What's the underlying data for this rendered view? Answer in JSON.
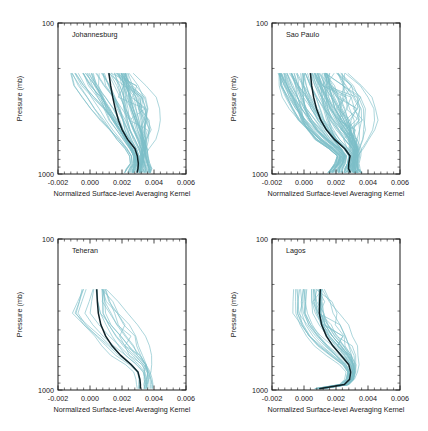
{
  "figure": {
    "layout": "2x2 grid of vertical profile line plots",
    "background_color": "#ffffff",
    "ensemble_color": "#7dbfc8",
    "mean_color": "#0e2127",
    "axis_color": "#1a1a1a"
  },
  "chart_data": [
    {
      "type": "line",
      "title": "Johannesburg",
      "xlabel": "Normalized Surface-level Averaging Kernel",
      "ylabel": "Pressure (mb)",
      "xlim": [
        -0.002,
        0.006
      ],
      "ylim": [
        100,
        1000
      ],
      "yscale": "log",
      "y_inverted": true,
      "xticks": [
        -0.002,
        0.0,
        0.002,
        0.004,
        0.006
      ],
      "xtick_labels": [
        "-0.002",
        "0.000",
        "0.002",
        "0.004",
        "0.006"
      ],
      "yticks": [
        100,
        1000
      ],
      "ytick_labels": [
        "100",
        "1000"
      ],
      "grid": false,
      "legend": "none",
      "pressure_levels": [
        215,
        260,
        310,
        370,
        440,
        510,
        590,
        680,
        760,
        850,
        920,
        980
      ],
      "series": [
        {
          "name": "mean",
          "style": "black-thick",
          "values": [
            0.00118,
            0.00129,
            0.00142,
            0.00158,
            0.00178,
            0.00201,
            0.00235,
            0.00281,
            0.00296,
            0.00302,
            0.003,
            0.00295
          ]
        },
        {
          "name": "ensemble-envelope-low",
          "style": "teal-thin",
          "values": [
            -0.0012,
            -0.00075,
            -0.00025,
            0.00025,
            0.00075,
            0.0012,
            0.00165,
            0.00215,
            0.00245,
            0.0025,
            0.00225,
            0.00215
          ]
        },
        {
          "name": "ensemble-envelope-high",
          "style": "teal-thin",
          "values": [
            0.00235,
            0.00255,
            0.00275,
            0.00292,
            0.0031,
            0.00325,
            0.0034,
            0.00355,
            0.0036,
            0.0037,
            0.00385,
            0.00385
          ]
        },
        {
          "name": "ensemble-outlier-right",
          "style": "teal-thin",
          "values": [
            0.0023,
            0.003,
            0.00345,
            0.00365,
            0.00372,
            0.00372,
            0.00365,
            0.0035,
            0.00332,
            0.00322,
            0.00318,
            0.00315
          ]
        }
      ],
      "ensemble_count_hint": 60
    },
    {
      "type": "line",
      "title": "Sao Paulo",
      "xlabel": "Normalized Surface-level Averaging Kernel",
      "ylabel": "Pressure (mb)",
      "xlim": [
        -0.002,
        0.006
      ],
      "ylim": [
        100,
        1000
      ],
      "yscale": "log",
      "y_inverted": true,
      "xticks": [
        -0.002,
        0.0,
        0.002,
        0.004,
        0.006
      ],
      "xtick_labels": [
        "-0.002",
        "0.000",
        "0.002",
        "0.004",
        "0.006"
      ],
      "yticks": [
        100,
        1000
      ],
      "ytick_labels": [
        "100",
        "1000"
      ],
      "grid": false,
      "legend": "none",
      "pressure_levels": [
        215,
        260,
        310,
        370,
        440,
        510,
        590,
        680,
        760,
        850,
        920,
        980
      ],
      "series": [
        {
          "name": "mean",
          "style": "black-thick",
          "values": [
            0.0004,
            0.00048,
            0.0006,
            0.00078,
            0.00105,
            0.0014,
            0.0019,
            0.00255,
            0.00288,
            0.0028,
            0.00278,
            0.0029
          ]
        },
        {
          "name": "ensemble-envelope-low",
          "style": "teal-thin",
          "values": [
            -0.0016,
            -0.00135,
            -0.00105,
            -0.0007,
            -0.0003,
            0.0002,
            0.0008,
            0.00165,
            0.00215,
            0.002,
            0.0017,
            0.0015
          ]
        },
        {
          "name": "ensemble-envelope-high",
          "style": "teal-thin",
          "values": [
            0.0016,
            0.00178,
            0.002,
            0.00228,
            0.00262,
            0.00295,
            0.0033,
            0.00355,
            0.00352,
            0.00345,
            0.0035,
            0.0037
          ]
        },
        {
          "name": "ensemble-outlier-right",
          "style": "teal-thin",
          "values": [
            0.00215,
            0.00285,
            0.0033,
            0.00355,
            0.00365,
            0.0036,
            0.0035,
            0.00338,
            0.00325,
            0.00318,
            0.00318,
            0.00325
          ]
        }
      ],
      "ensemble_count_hint": 90
    },
    {
      "type": "line",
      "title": "Teheran",
      "xlabel": "Normalized Surface-level Averaging Kernel",
      "ylabel": "Pressure (mb)",
      "xlim": [
        -0.002,
        0.006
      ],
      "ylim": [
        100,
        1000
      ],
      "yscale": "log",
      "y_inverted": true,
      "xticks": [
        -0.002,
        0.0,
        0.002,
        0.004,
        0.006
      ],
      "xtick_labels": [
        "-0.002",
        "0.000",
        "0.002",
        "0.004",
        "0.006"
      ],
      "yticks": [
        100,
        1000
      ],
      "ytick_labels": [
        "100",
        "1000"
      ],
      "grid": false,
      "legend": "none",
      "pressure_levels": [
        215,
        260,
        310,
        370,
        440,
        510,
        590,
        680,
        760,
        850,
        920,
        980
      ],
      "series": [
        {
          "name": "mean",
          "style": "black-thick",
          "values": [
            0.00042,
            0.00046,
            0.00052,
            0.00068,
            0.00098,
            0.00138,
            0.00192,
            0.00258,
            0.003,
            0.00312,
            0.00315,
            0.00315
          ]
        },
        {
          "name": "ensemble-envelope-low",
          "style": "teal-thin",
          "values": [
            -0.0005,
            -0.00085,
            -0.0012,
            -0.0006,
            0.0001,
            0.0007,
            0.0014,
            0.0023,
            0.00282,
            0.00292,
            0.00292,
            0.00292
          ]
        },
        {
          "name": "ensemble-envelope-high",
          "style": "teal-thin",
          "values": [
            0.00095,
            0.0011,
            0.00135,
            0.00175,
            0.00225,
            0.00272,
            0.0032,
            0.0036,
            0.00382,
            0.00395,
            0.004,
            0.004
          ]
        },
        {
          "name": "ensemble-outlier-right",
          "style": "teal-thin",
          "values": [
            0.00082,
            0.00132,
            0.00182,
            0.00232,
            0.00275,
            0.00305,
            0.0033,
            0.00352,
            0.0036,
            0.00352,
            0.00345,
            0.0034
          ]
        }
      ],
      "ensemble_count_hint": 16
    },
    {
      "type": "line",
      "title": "Lagos",
      "xlabel": "Normalized Surface-level Averaging Kernel",
      "ylabel": "Pressure (mb)",
      "xlim": [
        -0.002,
        0.006
      ],
      "ylim": [
        100,
        1000
      ],
      "yscale": "log",
      "y_inverted": true,
      "xticks": [
        -0.002,
        0.0,
        0.002,
        0.004,
        0.006
      ],
      "xtick_labels": [
        "-0.002",
        "0.000",
        "0.002",
        "0.004",
        "0.006"
      ],
      "yticks": [
        100,
        1000
      ],
      "ytick_labels": [
        "100",
        "1000"
      ],
      "grid": false,
      "legend": "none",
      "pressure_levels": [
        215,
        260,
        310,
        370,
        440,
        510,
        590,
        680,
        760,
        850,
        920,
        980
      ],
      "series": [
        {
          "name": "mean",
          "style": "black-thick",
          "values": [
            0.00102,
            0.00098,
            0.00096,
            0.0011,
            0.0014,
            0.0018,
            0.00232,
            0.0028,
            0.00292,
            0.00285,
            0.00252,
            0.00095
          ]
        },
        {
          "name": "ensemble-envelope-low",
          "style": "teal-thin",
          "values": [
            -0.00085,
            -0.00092,
            -0.00095,
            -0.0006,
            -0.0001,
            0.00055,
            0.00135,
            0.00225,
            0.00262,
            0.00252,
            0.00215,
            0.0006
          ]
        },
        {
          "name": "ensemble-envelope-high",
          "style": "teal-thin",
          "values": [
            0.00128,
            0.00135,
            0.0015,
            0.00182,
            0.00228,
            0.00272,
            0.0031,
            0.00325,
            0.00322,
            0.00315,
            0.00285,
            0.0012
          ]
        },
        {
          "name": "ensemble-outlier-right",
          "style": "teal-thin",
          "values": [
            0.0012,
            0.00155,
            0.00195,
            0.00238,
            0.00272,
            0.00298,
            0.00318,
            0.00328,
            0.00325,
            0.0031,
            0.00275,
            0.0011
          ]
        }
      ],
      "ensemble_count_hint": 30
    }
  ]
}
